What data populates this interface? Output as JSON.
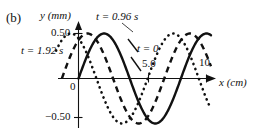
{
  "figure": {
    "panel_label": "(b)",
    "background_color": "#ffffff",
    "ink_color": "#111111"
  },
  "axes": {
    "y_title": "y (mm)",
    "x_title": "x (cm)",
    "origin_label": "0",
    "y_ticks": [
      {
        "label": "0.50",
        "value": 0.5
      },
      {
        "label": "−0.50",
        "value": -0.5
      }
    ],
    "x_ticks": [
      {
        "label": "5.0",
        "value": 5.0
      },
      {
        "label": "10",
        "value": 10
      }
    ]
  },
  "annotations": [
    {
      "name": "t-096",
      "text": "t = 0.96 s"
    },
    {
      "name": "t-192",
      "text": "t = 1.92 s"
    },
    {
      "name": "t-0",
      "text": "t = 0"
    }
  ],
  "chart_data": {
    "type": "line",
    "title": "",
    "xlabel": "x (cm)",
    "ylabel": "y (mm)",
    "xlim": [
      -1.4,
      10.7
    ],
    "ylim": [
      -0.62,
      0.62
    ],
    "grid": false,
    "legend": "inline-annotations",
    "wavelength_cm": 8.0,
    "amplitude_mm": 0.5,
    "period_s": 3.84,
    "series": [
      {
        "name": "t = 0",
        "style": "solid",
        "phase_shift_cm": 0.0,
        "label_text": "t = 0",
        "points": [
          {
            "x": 0.0,
            "y": 0.0
          },
          {
            "x": 0.5,
            "y": 0.195
          },
          {
            "x": 1.0,
            "y": 0.354
          },
          {
            "x": 1.5,
            "y": 0.462
          },
          {
            "x": 2.0,
            "y": 0.5
          },
          {
            "x": 2.5,
            "y": 0.462
          },
          {
            "x": 3.0,
            "y": 0.354
          },
          {
            "x": 3.5,
            "y": 0.195
          },
          {
            "x": 4.0,
            "y": 0.0
          },
          {
            "x": 4.5,
            "y": -0.195
          },
          {
            "x": 5.0,
            "y": -0.354
          },
          {
            "x": 5.5,
            "y": -0.462
          },
          {
            "x": 6.0,
            "y": -0.5
          },
          {
            "x": 6.5,
            "y": -0.462
          },
          {
            "x": 7.0,
            "y": -0.354
          },
          {
            "x": 7.5,
            "y": -0.195
          },
          {
            "x": 8.0,
            "y": 0.0
          },
          {
            "x": 8.5,
            "y": 0.195
          },
          {
            "x": 9.0,
            "y": 0.354
          },
          {
            "x": 9.5,
            "y": 0.462
          },
          {
            "x": 10.0,
            "y": 0.5
          }
        ]
      },
      {
        "name": "t = 0.96 s",
        "style": "dashed",
        "phase_shift_cm": -1.3,
        "label_text": "t = 0.96 s",
        "points": [
          {
            "x": -1.3,
            "y": 0.0
          },
          {
            "x": -0.8,
            "y": 0.195
          },
          {
            "x": -0.3,
            "y": 0.354
          },
          {
            "x": 0.2,
            "y": 0.462
          },
          {
            "x": 0.7,
            "y": 0.5
          },
          {
            "x": 1.2,
            "y": 0.462
          },
          {
            "x": 1.7,
            "y": 0.354
          },
          {
            "x": 2.2,
            "y": 0.195
          },
          {
            "x": 2.7,
            "y": 0.0
          },
          {
            "x": 3.2,
            "y": -0.195
          },
          {
            "x": 3.7,
            "y": -0.354
          },
          {
            "x": 4.2,
            "y": -0.462
          },
          {
            "x": 4.7,
            "y": -0.5
          },
          {
            "x": 5.2,
            "y": -0.462
          },
          {
            "x": 5.7,
            "y": -0.354
          },
          {
            "x": 6.2,
            "y": -0.195
          },
          {
            "x": 6.7,
            "y": 0.0
          },
          {
            "x": 7.2,
            "y": 0.195
          },
          {
            "x": 7.7,
            "y": 0.354
          },
          {
            "x": 8.2,
            "y": 0.462
          },
          {
            "x": 8.7,
            "y": 0.5
          },
          {
            "x": 9.2,
            "y": 0.462
          },
          {
            "x": 9.7,
            "y": 0.354
          },
          {
            "x": 10.2,
            "y": 0.195
          }
        ]
      },
      {
        "name": "t = 1.92 s",
        "style": "dotted",
        "phase_shift_cm": -2.6,
        "label_text": "t = 1.92 s",
        "points": [
          {
            "x": -2.6,
            "y": 0.0
          },
          {
            "x": -2.1,
            "y": 0.195
          },
          {
            "x": -1.6,
            "y": 0.354
          },
          {
            "x": -1.1,
            "y": 0.462
          },
          {
            "x": -0.6,
            "y": 0.5
          },
          {
            "x": -0.1,
            "y": 0.462
          },
          {
            "x": 0.4,
            "y": 0.354
          },
          {
            "x": 0.9,
            "y": 0.195
          },
          {
            "x": 1.4,
            "y": 0.0
          },
          {
            "x": 1.9,
            "y": -0.195
          },
          {
            "x": 2.4,
            "y": -0.354
          },
          {
            "x": 2.9,
            "y": -0.462
          },
          {
            "x": 3.4,
            "y": -0.5
          },
          {
            "x": 3.9,
            "y": -0.462
          },
          {
            "x": 4.4,
            "y": -0.354
          },
          {
            "x": 4.9,
            "y": -0.195
          },
          {
            "x": 5.4,
            "y": 0.0
          },
          {
            "x": 5.9,
            "y": 0.195
          },
          {
            "x": 6.4,
            "y": 0.354
          },
          {
            "x": 6.9,
            "y": 0.462
          },
          {
            "x": 7.4,
            "y": 0.5
          },
          {
            "x": 7.9,
            "y": 0.462
          },
          {
            "x": 8.4,
            "y": 0.354
          },
          {
            "x": 8.9,
            "y": 0.195
          },
          {
            "x": 9.4,
            "y": 0.0
          },
          {
            "x": 9.9,
            "y": -0.195
          },
          {
            "x": 10.4,
            "y": -0.354
          }
        ]
      }
    ]
  }
}
